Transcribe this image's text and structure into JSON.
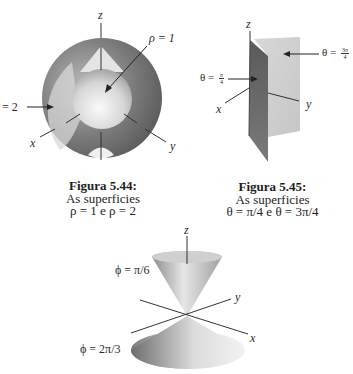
{
  "figure_544": {
    "axis_z": "z",
    "axis_x": "x",
    "axis_y": "y",
    "label_rho1": "ρ = 1",
    "label_rho2": "= 2",
    "caption": {
      "title": "Figura 5.44:",
      "line1": "As superficies",
      "line2": "ρ = 1 e ρ = 2"
    }
  },
  "figure_545": {
    "axis_z": "z",
    "axis_x": "x",
    "axis_y": "y",
    "label_theta1_prefix": "θ = ",
    "label_theta1_num": "π",
    "label_theta1_den": "4",
    "label_theta2_prefix": "θ = ",
    "label_theta2_num": "3π",
    "label_theta2_den": "4",
    "caption": {
      "title": "Figura 5.45:",
      "line1": "As superficies",
      "line2": "θ = π/4 e  θ = 3π/4"
    }
  },
  "figure_cones": {
    "axis_z": "z",
    "axis_x": "x",
    "axis_y": "y",
    "label_phi1": "ϕ = π/6",
    "label_phi2": "ϕ = 2π/3"
  },
  "colors": {
    "outer_sphere": "#6f6f6f",
    "inner_sphere": "#d9d9d9",
    "dark_plane": "#6a6a6a",
    "light_plane": "#d2d2d2",
    "cone": "#a8a8a8"
  }
}
